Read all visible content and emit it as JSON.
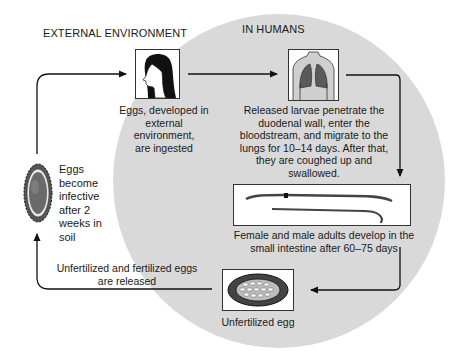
{
  "regions": {
    "external": "EXTERNAL ENVIRONMENT",
    "humans": "IN HUMANS"
  },
  "steps": [
    {
      "id": "ingestion",
      "image": "woman-head-profile-icon",
      "text": [
        "Eggs, developed in",
        "external environment,",
        "are ingested"
      ]
    },
    {
      "id": "lungs",
      "image": "lungs-torso-icon",
      "text": [
        "Released larvae penetrate the",
        "duodenal wall, enter the",
        "bloodstream, and migrate to the",
        "lungs for 10–14 days. After that,",
        "they are coughed up and",
        "swallowed."
      ]
    },
    {
      "id": "adults",
      "image": "adult-worms-icon",
      "text": [
        "Female and male adults develop in the",
        "small intestine after 60–75 days"
      ]
    },
    {
      "id": "unfertilized-egg",
      "image": "unfertilized-egg-icon",
      "text": [
        "Unfertilized egg"
      ]
    },
    {
      "id": "release",
      "text": [
        "Unfertilized and fertilized eggs",
        "are released"
      ]
    },
    {
      "id": "infective",
      "image": "fertilized-egg-icon",
      "text": [
        "Eggs",
        "become",
        "infective",
        "after 2",
        "weeks in",
        "soil"
      ]
    }
  ],
  "colors": {
    "circle": "#d9d9d9",
    "lungs": "#5a5a5a",
    "ink": "#1a1a1a"
  }
}
